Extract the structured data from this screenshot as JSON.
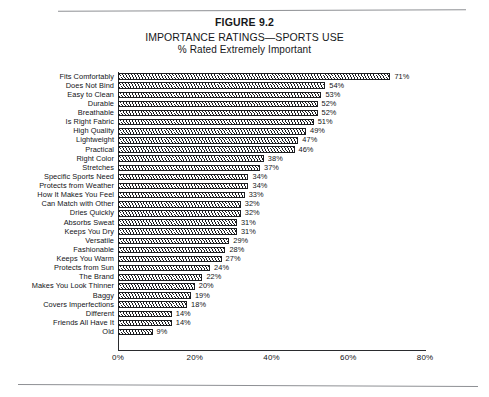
{
  "figure": {
    "label": "FIGURE 9.2",
    "title": "IMPORTANCE RATINGS—SPORTS USE",
    "subtitle": "% Rated Extremely Important"
  },
  "chart_data": {
    "type": "bar",
    "orientation": "horizontal",
    "title": "IMPORTANCE RATINGS—SPORTS USE",
    "subtitle": "% Rated Extremely Important",
    "xlabel": "",
    "ylabel": "",
    "xlim": [
      0,
      80
    ],
    "xticks": [
      "0%",
      "20%",
      "40%",
      "60%",
      "80%"
    ],
    "xtick_values": [
      0,
      20,
      40,
      60,
      80
    ],
    "grid": false,
    "legend": false,
    "value_suffix": "%",
    "bar_style": "diagonal-hatch",
    "categories": [
      "Fits  Comfortably",
      "Does  Not  Bind",
      "Easy  to  Clean",
      "Durable",
      "Breathable",
      "Is  Right  Fabric",
      "High  Quality",
      "Lightweight",
      "Practical",
      "Right  Color",
      "Stretches",
      "Specific Sports Need",
      "Protects from Weather",
      "How It Makes You Feel",
      "Can Match with Other",
      "Dries Quickly",
      "Absorbs Sweat",
      "Keeps You Dry",
      "Versatile",
      "Fashionable",
      "Keeps You Warm",
      "Protects from Sun",
      "The Brand",
      "Makes You Look Thinner",
      "Baggy",
      "Covers Imperfections",
      "Different",
      "Friends All Have It",
      "Old"
    ],
    "values": [
      71,
      54,
      53,
      52,
      52,
      51,
      49,
      47,
      46,
      38,
      37,
      34,
      34,
      33,
      32,
      32,
      31,
      31,
      29,
      28,
      27,
      24,
      22,
      20,
      19,
      18,
      14,
      14,
      9
    ],
    "labels": [
      "71%",
      "54%",
      "53%",
      "52%",
      "52%",
      "51%",
      "49%",
      "47%",
      "46%",
      "38%",
      "37%",
      "34%",
      "34%",
      "33%",
      "32%",
      "32%",
      "31%",
      "31%",
      "29%",
      "28%",
      "27%",
      "24%",
      "22%",
      "20%",
      "19%",
      "18%",
      "14%",
      "14%",
      "9%"
    ]
  }
}
